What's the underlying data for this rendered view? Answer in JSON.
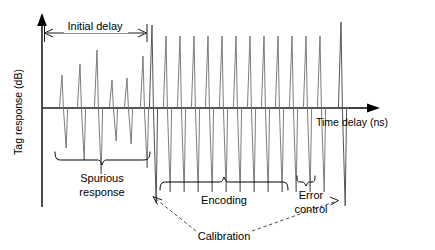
{
  "figure": {
    "background_color": "#ffffff",
    "width": 435,
    "height": 250
  },
  "axes": {
    "y_label": "Tag response (dB)",
    "x_label": "Time delay (ns)",
    "origin": {
      "x": 42,
      "y": 108
    },
    "y_axis_top": 18,
    "y_axis_bottom": 207,
    "x_axis_right": 378,
    "axis_color": "#000000"
  },
  "annotations": {
    "initial_delay": {
      "label": "Initial delay",
      "type": "double-headed-dimension-arrow",
      "x_start": 44,
      "x_end": 147,
      "y": 33,
      "label_x": 95,
      "label_y": 27
    },
    "spurious_response": {
      "label_line1": "Spurious",
      "label_line2": "response",
      "type": "brace-below",
      "x_start": 55,
      "x_end": 150,
      "y": 160,
      "label_x": 102,
      "label_y": 182
    },
    "encoding": {
      "label": "Encoding",
      "type": "brace-below",
      "x_start": 160,
      "x_end": 288,
      "y": 182,
      "label_x": 224,
      "label_y": 204
    },
    "error_control": {
      "label_line1": "Error",
      "label_line2": "control",
      "type": "brace-below",
      "x_start": 297,
      "x_end": 322,
      "y": 182,
      "label_x": 310,
      "label_y": 203
    },
    "calibration": {
      "label": "Calibration",
      "type": "dashed-leader-two-arrows",
      "label_x": 222,
      "label_y": 236,
      "target_left_x": 152,
      "target_left_y": 196,
      "target_right_x": 341,
      "target_right_y": 198
    }
  },
  "chart_data": {
    "type": "line",
    "xlabel": "Time delay (ns)",
    "ylabel": "Tag response (dB)",
    "grid": false,
    "legend": false,
    "axis_ticks": false,
    "baseline_y_px": 108,
    "pulse_shape": "bipolar-spike-up-then-down",
    "series": [
      {
        "name": "Spurious response",
        "region": "initial-delay",
        "pulse_color": "#6e6e6e",
        "x_px": [
          62,
          80,
          97,
          112,
          127,
          143
        ],
        "amplitude_up_px": [
          33,
          44,
          58,
          28,
          30,
          52
        ],
        "amplitude_down_px": [
          40,
          52,
          66,
          33,
          36,
          60
        ]
      },
      {
        "name": "Calibration start pulse",
        "region": "calibration",
        "pulse_color": "#555555",
        "x_px": [
          152
        ],
        "amplitude_up_px": [
          83
        ],
        "amplitude_down_px": [
          95
        ]
      },
      {
        "name": "Encoding",
        "region": "encoding",
        "pulse_color": "#6e6e6e",
        "x_px": [
          166,
          180,
          194,
          208,
          222,
          236,
          250,
          264,
          278,
          292
        ],
        "amplitude_up_px": [
          72,
          72,
          72,
          72,
          72,
          72,
          72,
          72,
          72,
          72
        ],
        "amplitude_down_px": [
          84,
          84,
          84,
          84,
          84,
          84,
          84,
          84,
          84,
          84
        ]
      },
      {
        "name": "Error control",
        "region": "error-control",
        "pulse_color": "#6e6e6e",
        "x_px": [
          306,
          320
        ],
        "amplitude_up_px": [
          72,
          72
        ],
        "amplitude_down_px": [
          84,
          84
        ]
      },
      {
        "name": "Calibration end pulse",
        "region": "calibration",
        "pulse_color": "#555555",
        "x_px": [
          341
        ],
        "amplitude_up_px": [
          86
        ],
        "amplitude_down_px": [
          98
        ]
      }
    ]
  }
}
